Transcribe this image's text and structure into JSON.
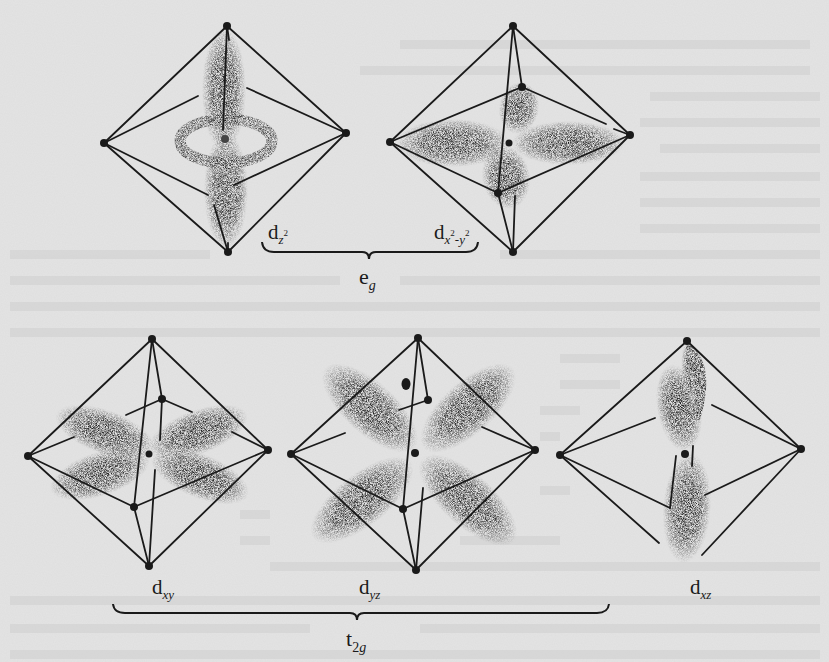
{
  "figure": {
    "orbitals": [
      {
        "id": "dz2",
        "base": "d",
        "sub": "z",
        "sup": "2",
        "group": "eg"
      },
      {
        "id": "dx2y2",
        "base": "d",
        "sub_a": "x",
        "sup_a": "2",
        "sub_sep": "-",
        "sub_b": "y",
        "sup_b": "2",
        "group": "eg"
      },
      {
        "id": "dxy",
        "base": "d",
        "sub": "xy",
        "group": "t2g"
      },
      {
        "id": "dyz",
        "base": "d",
        "sub": "yz",
        "group": "t2g"
      },
      {
        "id": "dxz",
        "base": "d",
        "sub": "xz",
        "group": "t2g"
      }
    ],
    "groups": {
      "eg": {
        "base": "e",
        "sub": "g"
      },
      "t2g": {
        "base": "t",
        "sub_num": "2",
        "sub": "g"
      }
    }
  },
  "colors": {
    "paper": "#e4e4e4",
    "ink": "#1a1a1a",
    "cloud": "#141414"
  }
}
